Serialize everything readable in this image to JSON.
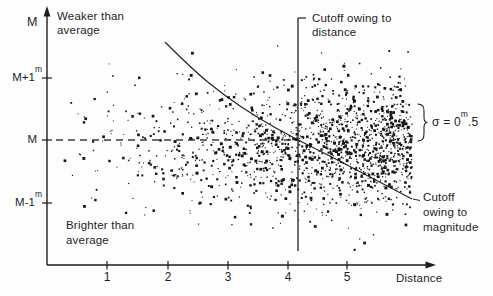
{
  "figure": {
    "y_axis": {
      "arrow_label": "M",
      "weaker": [
        "Weaker than",
        "average"
      ],
      "ticks": [
        {
          "label": "M+1",
          "sup": "m"
        },
        {
          "label": "M",
          "sup": ""
        },
        {
          "label": "M-1",
          "sup": "m"
        }
      ]
    },
    "x_axis": {
      "axis_label": "Distance",
      "ticks": [
        {
          "label": "1"
        },
        {
          "label": "2"
        },
        {
          "label": "3"
        },
        {
          "label": "4"
        },
        {
          "label": "5"
        }
      ]
    },
    "annotations": {
      "cutoff_distance": [
        "Cutoff owing to",
        "distance"
      ],
      "cutoff_magnitude": [
        "Cutoff",
        "owing to",
        "magnitude"
      ],
      "brighter": [
        "Brighter than",
        "average"
      ],
      "sigma": {
        "prefix": "σ = 0",
        "sup": "m",
        "suffix": ".5"
      }
    },
    "colors": {
      "ink": "#1f1f1f",
      "background": "#fdfdfd"
    }
  },
  "chart_data": {
    "type": "scatter",
    "title": "",
    "xlabel": "Distance",
    "ylabel": "",
    "x_ticks": [
      1,
      2,
      3,
      4,
      5
    ],
    "y_tick_labels": [
      "M+1m",
      "M",
      "M-1m"
    ],
    "quadrant_labels": [
      "Weaker than average (top)",
      "Brighter than average (bottom)"
    ],
    "annotations": [
      "Cutoff owing to distance",
      "Cutoff owing to magnitude",
      "σ = 0m.5"
    ],
    "dispersion_magnitudes": 0.5,
    "mapping": {
      "x_origin_px": 47,
      "x_axis_y_px": 265,
      "px_per_distance_unit": 60,
      "mean_line_y_px": 140,
      "px_per_magnitude": 62.5,
      "x_tick_px": [
        107,
        168,
        228,
        288,
        347
      ],
      "y_tick_px": [
        78,
        140,
        203
      ],
      "x_axis_end_px": 430,
      "y_axis_top_px": 14
    },
    "mean_dashed_line_px": {
      "x1": 56,
      "x2": 297,
      "y": 140
    },
    "distance_cutoff_line": {
      "x_px": 298,
      "y_top_px": 18,
      "y_bottom_px": 251,
      "distance_value": 4.2
    },
    "magnitude_cutoff_curve_px": [
      [
        165,
        42
      ],
      [
        193,
        70
      ],
      [
        225,
        96
      ],
      [
        258,
        118
      ],
      [
        292,
        137
      ],
      [
        330,
        156
      ],
      [
        370,
        177
      ],
      [
        412,
        199
      ]
    ],
    "magnitude_cutoff_leader_px": [
      [
        413,
        199
      ],
      [
        420,
        200.5
      ]
    ],
    "sigma_brace": {
      "x_px": 417.5,
      "y_top_px": 104,
      "y_bottom_px": 141
    },
    "scatter": {
      "description": "schematic random sample: Gaussian magnitude residual (sigma = 0.5 mag) about mean M, point density increasing with distance (volume effect)",
      "count": 1600,
      "seed": 20,
      "x_min_px": 58,
      "x_max_px": 412,
      "x_cube_origin_px": 40,
      "x_cube_span_px": 372,
      "uniform_fraction": 0.08,
      "uniform_x_min_px": 70,
      "uniform_x_span_px": 338,
      "y_mean_px": 146,
      "y_sigma_px": 32,
      "y_min_px": 40,
      "y_max_px": 254,
      "dot_base_px": 1.0,
      "dot_var_px": 2.0,
      "dot_color": "#161616"
    }
  }
}
